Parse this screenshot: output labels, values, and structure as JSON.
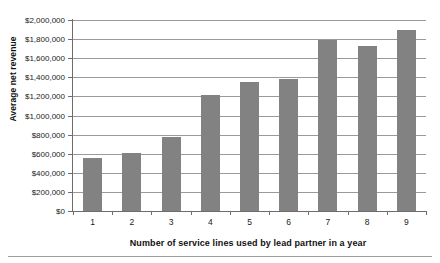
{
  "figure": {
    "top_cut_caption": "",
    "bottom_rule": "horizontal-rule"
  },
  "chart_data": {
    "type": "bar",
    "title": "",
    "xlabel": "Number of service lines used by lead partner in a year",
    "ylabel": "Average net revenue",
    "categories": [
      "1",
      "2",
      "3",
      "4",
      "5",
      "6",
      "7",
      "8",
      "9"
    ],
    "values": [
      550000,
      610000,
      775000,
      1215000,
      1350000,
      1385000,
      1790000,
      1730000,
      1900000
    ],
    "ylim": [
      0,
      2000000
    ],
    "ytick_values": [
      0,
      200000,
      400000,
      600000,
      800000,
      1000000,
      1200000,
      1400000,
      1600000,
      1800000,
      2000000
    ],
    "ytick_labels": [
      "$0",
      "$200,000",
      "$400,000",
      "$600,000",
      "$800,000",
      "$1,000,000",
      "$1,200,000",
      "$1,400,000",
      "$1,600,000",
      "$1,800,000",
      "$2,000,000"
    ],
    "grid": true,
    "grid_axis": "y",
    "legend": false,
    "legend_position": "none",
    "bar_color": "#828282",
    "grid_color": "#9a9a9a",
    "axis_color": "#6d6d6d",
    "background_color": "#ffffff"
  }
}
